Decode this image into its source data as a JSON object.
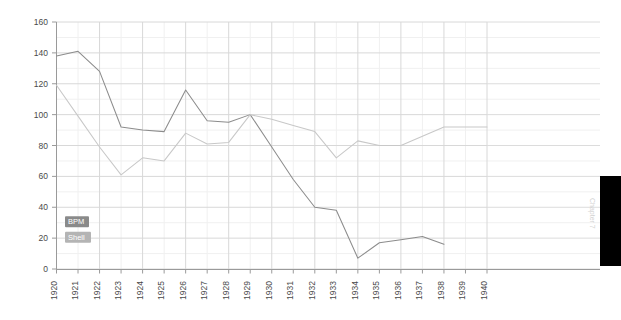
{
  "page": {
    "background_color": "#ffffff",
    "edge_marker": {
      "name": "black-tab",
      "color": "#000000"
    },
    "chapter_label": "Chapter 7"
  },
  "chart_data": {
    "type": "line",
    "title": "",
    "subtitle": "",
    "xlabel": "",
    "ylabel": "",
    "xlim": [
      1920,
      1940
    ],
    "ylim": [
      0,
      160
    ],
    "ytick_step": 20,
    "grid": true,
    "minor_grid": true,
    "legend_position": "inside-left",
    "x": [
      1920,
      1921,
      1922,
      1923,
      1924,
      1925,
      1926,
      1927,
      1928,
      1929,
      1930,
      1931,
      1932,
      1933,
      1934,
      1935,
      1936,
      1937,
      1938,
      1939,
      1940
    ],
    "yticks": [
      0,
      20,
      40,
      60,
      80,
      100,
      120,
      140,
      160
    ],
    "xticks": [
      "1920",
      "1921",
      "1922",
      "1923",
      "1924",
      "1925",
      "1926",
      "1927",
      "1928",
      "1929",
      "1930",
      "1931",
      "1932",
      "1933",
      "1934",
      "1935",
      "1936",
      "1937",
      "1938",
      "1939",
      "1940"
    ],
    "series": [
      {
        "name": "BPM",
        "color": "#8c8c8c",
        "legend_bg": "#8a8a8a",
        "values": [
          138,
          141,
          128,
          92,
          90,
          89,
          116,
          96,
          95,
          100,
          79,
          58,
          40,
          38,
          7,
          17,
          19,
          21,
          16,
          null,
          null
        ]
      },
      {
        "name": "Shell",
        "color": "#c8c8c8",
        "legend_bg": "#b4b4b4",
        "values": [
          119,
          99,
          79,
          61,
          72,
          70,
          88,
          81,
          82,
          100,
          97,
          93,
          89,
          72,
          83,
          80,
          80,
          86,
          92,
          92,
          92
        ]
      }
    ]
  }
}
